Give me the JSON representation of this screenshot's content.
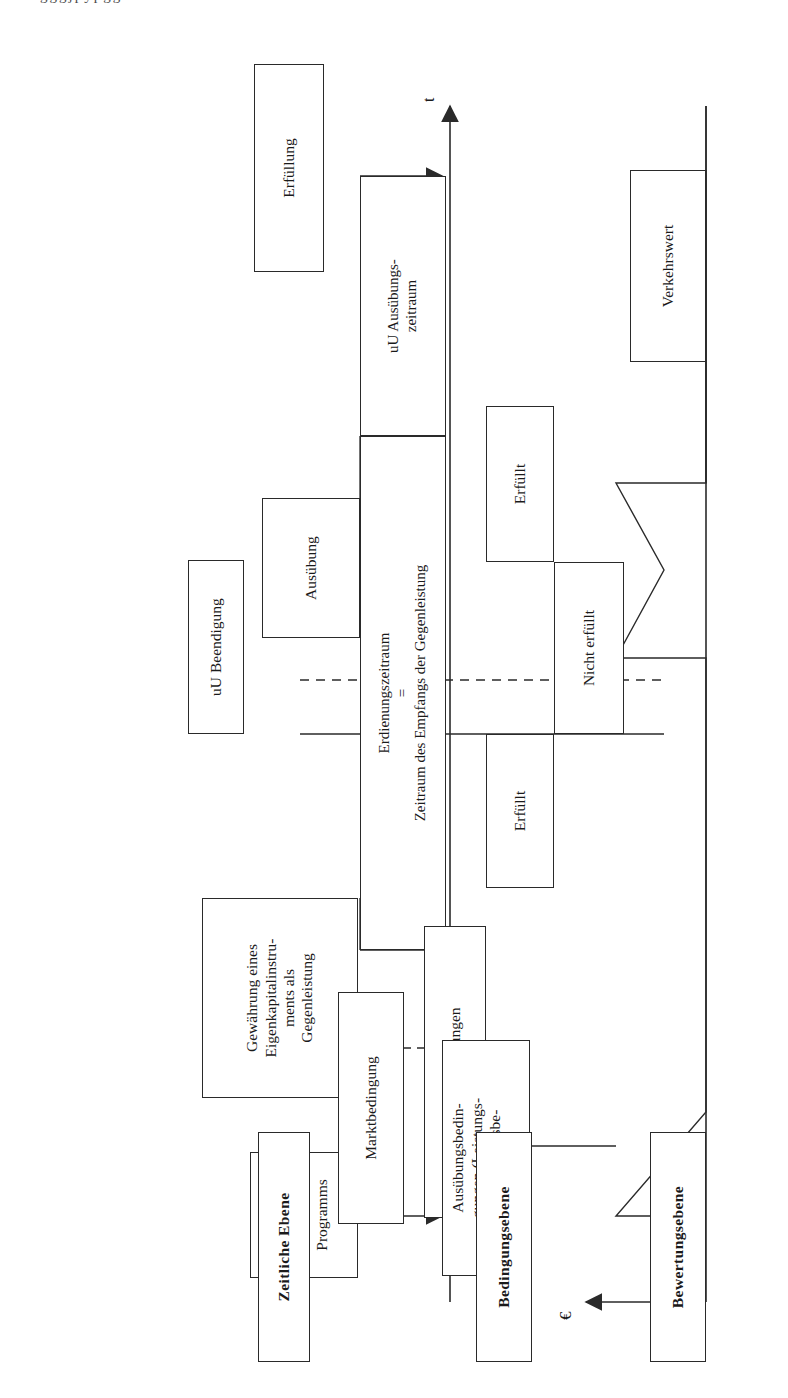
{
  "figure": {
    "type": "timeline-flow-diagram",
    "language": "de",
    "top_cut_caption": "gggjpypgg"
  },
  "levels": {
    "time_level": "Zeitliche Ebene",
    "condition_level": "Bedingungsebene",
    "valuation_level": "Bewertungsebene"
  },
  "axes": {
    "time_axis_label": "t",
    "value_axis_label": "€"
  },
  "time_level_boxes": {
    "programme_adoption": "Verabschiedung des\nProgramms",
    "grant": "Gewährung eines\nEigenkapitalinstru-\nments als\nGegenleistung",
    "exercise": "Ausübung",
    "fulfilment": "Erfüllung",
    "possible_termination": "uU Beendigung",
    "vesting_period": "Erdienungszeitraum\n=\nZeitraum des Empfangs der Gegenleistung",
    "possible_exercise_period": "uU Ausübungs-\nzeitraum"
  },
  "condition_level_boxes": {
    "fulfilled_left": "Erfüllt",
    "not_fulfilled": "Nicht erfüllt",
    "fulfilled_right": "Erfüllt",
    "option_conditions": "Optionsbedingungen",
    "market_condition": "Marktbedingung",
    "exercise_conditions": "Ausübungsbedin-\ngungen (Leistungs-\noder Erfolgsbe-\ndingung"
  },
  "valuation_level_boxes": {
    "fair_value": "Verkehrswert"
  },
  "chart_data": {
    "type": "line",
    "title": "Verkehrswert",
    "xlabel": "t",
    "ylabel": "€",
    "series": [
      {
        "name": "Verkehrswert",
        "points": [
          {
            "t": 0.0,
            "v": 0.0
          },
          {
            "t": 0.14,
            "v": 0.56
          },
          {
            "t": 0.22,
            "v": 0.0
          },
          {
            "t": 0.55,
            "v": 0.0
          },
          {
            "t": 0.62,
            "v": 0.6
          },
          {
            "t": 0.73,
            "v": 0.28
          },
          {
            "t": 0.85,
            "v": 0.62
          },
          {
            "t": 0.88,
            "v": 0.0
          }
        ]
      }
    ],
    "grid": false,
    "legend": "none"
  },
  "colors": {
    "stroke": "#2a2a2a",
    "background": "#ffffff"
  }
}
